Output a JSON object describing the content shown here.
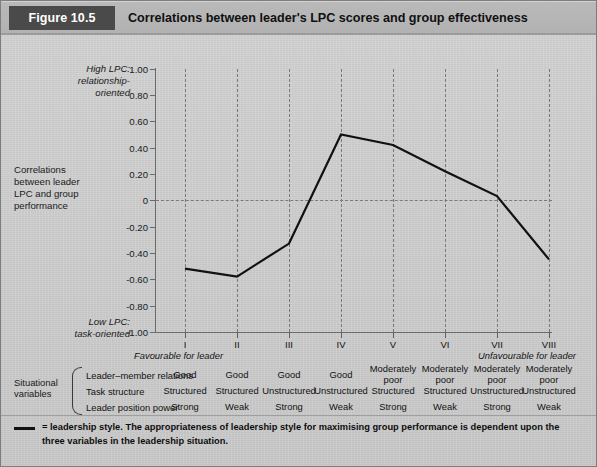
{
  "header": {
    "figure_label": "Figure 10.5",
    "title": "Correlations between leader's LPC scores and group effectiveness"
  },
  "annotations": {
    "high_lpc": "High LPC:\nrelationship-\noriented",
    "high_lpc_line1": "High LPC:",
    "high_lpc_line2": "relationship-",
    "high_lpc_line3": "oriented",
    "y_axis_title_line1": "Correlations",
    "y_axis_title_line2": "between leader",
    "y_axis_title_line3": "LPC and group",
    "y_axis_title_line4": "performance",
    "low_lpc_line1": "Low LPC:",
    "low_lpc_line2": "task-oriented",
    "favourable": "Favourable for leader",
    "unfavourable": "Unfavourable for leader"
  },
  "variables": {
    "group_label_line1": "Situational",
    "group_label_line2": "variables",
    "rows": [
      "Leader–member relations",
      "Task structure",
      "Leader position power"
    ],
    "values": [
      [
        "Good",
        "Good",
        "Good",
        "Good",
        "Moderately poor",
        "Moderately poor",
        "Moderately poor",
        "Moderately poor"
      ],
      [
        "Structured",
        "Structured",
        "Unstructured",
        "Unstructured",
        "Structured",
        "Structured",
        "Unstructured",
        "Unstructured"
      ],
      [
        "Strong",
        "Weak",
        "Strong",
        "Weak",
        "Strong",
        "Weak",
        "Strong",
        "Weak"
      ]
    ]
  },
  "footnote": {
    "marker_name": "leadership-style-line-marker",
    "text": "= leadership style.  The appropriateness of leadership style for maximising group performance is dependent upon the three variables in the leadership situation."
  },
  "colors": {
    "badge_bg": "#4a4a4a",
    "badge_text": "#ffffff",
    "header_bg": "#b4b4b4",
    "page_bg": "#cfcfcf",
    "series_line": "#111111",
    "grid_dash": "#7a7a7a",
    "axis": "#6a6a6a"
  },
  "chart_data": {
    "type": "line",
    "title": "Correlations between leader's LPC scores and group effectiveness",
    "xlabel": "",
    "ylabel": "Correlations between leader LPC and group performance",
    "categories": [
      "I",
      "II",
      "III",
      "IV",
      "V",
      "VI",
      "VII",
      "VIII"
    ],
    "values": [
      -0.52,
      -0.58,
      -0.33,
      0.5,
      0.42,
      0.22,
      0.03,
      -0.45
    ],
    "series": [
      {
        "name": "leadership style",
        "values": [
          -0.52,
          -0.58,
          -0.33,
          0.5,
          0.42,
          0.22,
          0.03,
          -0.45
        ]
      }
    ],
    "ylim": [
      -1.0,
      1.0
    ],
    "yticks": [
      1.0,
      0.8,
      0.6,
      0.4,
      0.2,
      0,
      -0.2,
      -0.4,
      -0.6,
      -0.8,
      -1.0
    ],
    "ytick_labels": [
      "1.00",
      "0.80",
      "0.60",
      "0.40",
      "0.20",
      "0",
      "-0.20",
      "-0.40",
      "-0.60",
      "-0.80",
      "-1.00"
    ],
    "grid": "vertical-dashed-plus-zero-line",
    "legend": "none",
    "annotations": {
      "top": "High LPC: relationship-oriented",
      "bottom": "Low LPC: task-oriented",
      "left_of_axis": "Favourable for leader",
      "right_of_axis": "Unfavourable for leader"
    }
  }
}
